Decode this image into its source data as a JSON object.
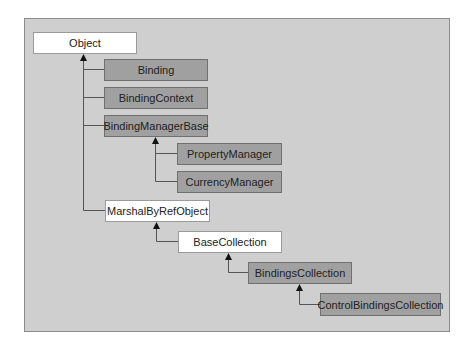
{
  "diagram": {
    "type": "class-hierarchy",
    "colors": {
      "frame_bg": "#cfcfcf",
      "frame_border": "#8c8c8c",
      "light_node": "#ffffff",
      "dark_node": "#a0a0a0",
      "line": "#555555"
    },
    "nodes": [
      {
        "id": "object",
        "label": "Object",
        "style": "light"
      },
      {
        "id": "binding",
        "label": "Binding",
        "style": "dark",
        "parent": "object"
      },
      {
        "id": "binding-context",
        "label": "BindingContext",
        "style": "dark",
        "parent": "object"
      },
      {
        "id": "binding-manager-base",
        "label": "BindingManagerBase",
        "style": "dark",
        "parent": "object"
      },
      {
        "id": "property-manager",
        "label": "PropertyManager",
        "style": "dark",
        "parent": "binding-manager-base"
      },
      {
        "id": "currency-manager",
        "label": "CurrencyManager",
        "style": "dark",
        "parent": "binding-manager-base"
      },
      {
        "id": "marshal-by-ref-object",
        "label": "MarshalByRefObject",
        "style": "light",
        "parent": "object"
      },
      {
        "id": "base-collection",
        "label": "BaseCollection",
        "style": "light",
        "parent": "marshal-by-ref-object"
      },
      {
        "id": "bindings-collection",
        "label": "BindingsCollection",
        "style": "dark",
        "parent": "base-collection"
      },
      {
        "id": "control-bindings-collection",
        "label": "ControlBindingsCollection",
        "style": "dark",
        "parent": "bindings-collection"
      }
    ]
  }
}
